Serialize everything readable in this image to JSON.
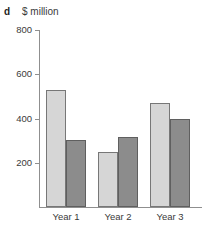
{
  "panel": {
    "label": "d"
  },
  "chart_data": {
    "type": "bar",
    "title": "",
    "subtitle": "",
    "xlabel": "",
    "ylabel": "$ million",
    "axis_title": "$ million",
    "categories": [
      "Year 1",
      "Year 2",
      "Year 3"
    ],
    "series": [
      {
        "name": "series-light",
        "color": "#d6d6d6",
        "values": [
          530,
          250,
          470
        ]
      },
      {
        "name": "series-dark",
        "color": "#8c8c8c",
        "values": [
          305,
          318,
          400
        ]
      }
    ],
    "ylim": [
      0,
      800
    ],
    "yticks": [
      200,
      400,
      600,
      800
    ],
    "ytick_labels": [
      "200",
      "400",
      "600",
      "800"
    ],
    "grid": false,
    "legend": "none",
    "axis_color": "#8f8f8f"
  }
}
